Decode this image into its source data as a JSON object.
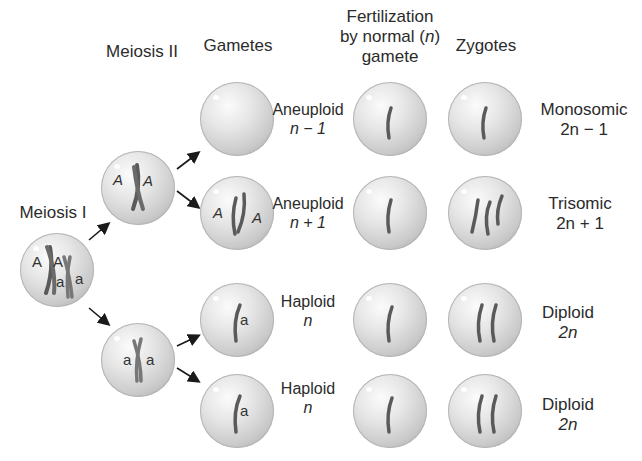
{
  "diagram": {
    "column_headers": {
      "gametes": "Gametes",
      "fertilization_line1": "Fertilization",
      "fertilization_line2": "by normal (",
      "fertilization_n": "n",
      "fertilization_close": ")",
      "fertilization_line3": "gamete",
      "zygotes": "Zygotes"
    },
    "stage_labels": {
      "meiosis_1": "Meiosis I",
      "meiosis_2": "Meiosis II"
    },
    "parent_cell": {
      "alleles": [
        "A",
        "A",
        "a",
        "a"
      ]
    },
    "meiosis2_cells": [
      {
        "alleles": [
          "A",
          "A"
        ],
        "note": "nondisjunction"
      },
      {
        "alleles": [
          "a",
          "a"
        ]
      }
    ],
    "rows": [
      {
        "gamete_type": "Aneuploid",
        "gamete_formula": "n − 1",
        "gamete_alleles": [],
        "zygote_type": "Monosomic",
        "zygote_formula": "2n − 1",
        "zygote_chromosomes": 1
      },
      {
        "gamete_type": "Aneuploid",
        "gamete_formula": "n + 1",
        "gamete_alleles": [
          "A",
          "A"
        ],
        "zygote_type": "Trisomic",
        "zygote_formula": "2n + 1",
        "zygote_chromosomes": 3
      },
      {
        "gamete_type": "Haploid",
        "gamete_formula": "n",
        "gamete_alleles": [
          "a"
        ],
        "zygote_type": "Diploid",
        "zygote_formula": "2n",
        "zygote_chromosomes": 2
      },
      {
        "gamete_type": "Haploid",
        "gamete_formula": "n",
        "gamete_alleles": [
          "a"
        ],
        "zygote_type": "Diploid",
        "zygote_formula": "2n",
        "zygote_chromosomes": 2
      }
    ],
    "colors": {
      "chromosome": "#5a5a5a",
      "cell_edge": "#9e9e9e",
      "arrow": "#1a1a1a",
      "text": "#2b2b2b"
    }
  }
}
